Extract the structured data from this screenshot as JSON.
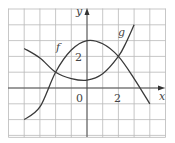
{
  "chart_data": {
    "type": "line",
    "title": "",
    "xlabel": "x",
    "ylabel": "y",
    "xlim": [
      -5,
      5
    ],
    "ylim": [
      -3,
      5
    ],
    "grid": true,
    "grid_step": 1,
    "x_ticks_labeled": [
      {
        "value": 0,
        "label": "0"
      },
      {
        "value": 2,
        "label": "2"
      }
    ],
    "y_ticks_labeled": [
      {
        "value": 2,
        "label": "2"
      }
    ],
    "series": [
      {
        "name": "f",
        "label_position": [
          -1.6,
          2.6
        ],
        "x": [
          -4,
          -3,
          -2,
          -1,
          0,
          1,
          2,
          3,
          4
        ],
        "y": [
          -2,
          -1.2,
          1,
          2.4,
          3,
          2.8,
          2,
          0.6,
          -1
        ]
      },
      {
        "name": "g",
        "label_position": [
          2.3,
          3.6
        ],
        "x": [
          -4,
          -3,
          -2,
          -1,
          0,
          1,
          2,
          2.5,
          3
        ],
        "y": [
          2.5,
          1.9,
          1,
          0.6,
          0.5,
          0.9,
          2,
          2.9,
          4
        ]
      }
    ],
    "intersections": [
      [
        -2,
        1
      ],
      [
        2,
        2
      ]
    ],
    "annotations": [
      "f",
      "g"
    ]
  },
  "labels": {
    "x_axis": "x",
    "y_axis": "y",
    "origin": "0",
    "x_tick_2": "2",
    "y_tick_2": "2",
    "curve_f": "f",
    "curve_g": "g"
  }
}
